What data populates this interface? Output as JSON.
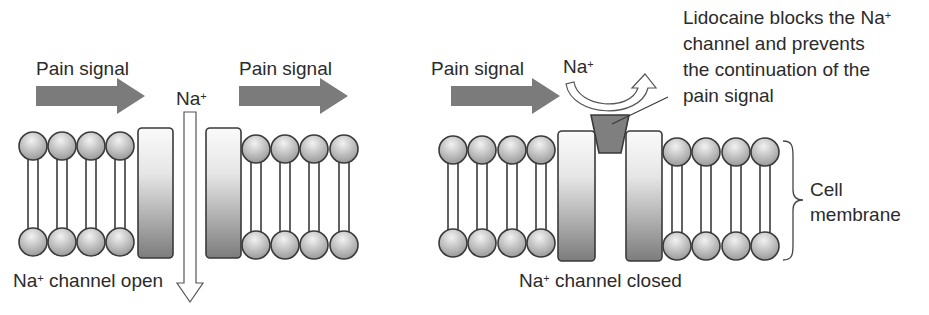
{
  "figure": {
    "left_panel": {
      "signal_label_1": "Pain signal",
      "signal_label_2": "Pain signal",
      "ion": "Na",
      "ion_charge": "+",
      "caption_ion": "Na",
      "caption_charge": "+",
      "caption_text": " channel open"
    },
    "right_panel": {
      "signal_label": "Pain signal",
      "ion": "Na",
      "ion_charge": "+",
      "annotation_line1_a": "Lidocaine blocks the Na",
      "annotation_line1_charge": "+",
      "annotation_line2": "channel and prevents",
      "annotation_line3": "the continuation of the",
      "annotation_line4": "pain signal",
      "membrane_label_line1": "Cell",
      "membrane_label_line2": "membrane",
      "caption_ion": "Na",
      "caption_charge": "+",
      "caption_text": " channel closed"
    },
    "colors": {
      "arrow_fill": "#7b7b7b",
      "blocker_fill": "#7f7f7f",
      "outline": "#3a3a3a",
      "background": "#ffffff"
    }
  }
}
